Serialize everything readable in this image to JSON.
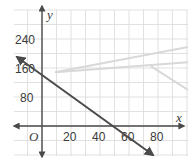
{
  "chart_data": {
    "type": "line",
    "title": "",
    "xlabel": "x",
    "ylabel": "y",
    "origin_label": "O",
    "xlim": [
      -20,
      100
    ],
    "ylim": [
      -80,
      320
    ],
    "grid": true,
    "x_ticks": [
      20,
      40,
      60,
      80
    ],
    "y_ticks": [
      80,
      160,
      240
    ],
    "x_tick_labels": [
      "20",
      "40",
      "60",
      "80"
    ],
    "y_tick_labels": [
      "80",
      "160",
      "240"
    ],
    "x_grid_step": 10,
    "y_grid_step": 40,
    "series": [
      {
        "name": "boundary line",
        "style": "solid, dark gray, arrows at both ends",
        "color": "#4a4a4a",
        "points": [
          [
            -18,
            190
          ],
          [
            77,
            -80
          ]
        ],
        "approx_equation": "y = 150 - 2.8x",
        "y_intercept": 150,
        "x_intercept": 53
      },
      {
        "name": "faint upper line",
        "style": "light gray, faded",
        "color": "#d8d8d8",
        "points": [
          [
            9,
            148
          ],
          [
            101,
            218
          ]
        ]
      },
      {
        "name": "faint lower line",
        "style": "light gray, faded",
        "color": "#d8d8d8",
        "points": [
          [
            9,
            148
          ],
          [
            101,
            176
          ]
        ]
      },
      {
        "name": "faint short line",
        "style": "light gray, faded",
        "color": "#d8d8d8",
        "points": [
          [
            75,
            165
          ],
          [
            101,
            99
          ]
        ]
      }
    ],
    "colors": {
      "grid": "#d9d9d9",
      "axis": "#4a4a4a",
      "background": "#ffffff"
    }
  }
}
